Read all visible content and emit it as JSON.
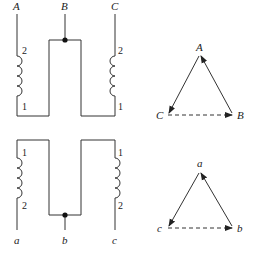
{
  "diagram": {
    "primary": {
      "terminals": [
        "A",
        "B",
        "C"
      ],
      "coil_left_labels": {
        "top": "2",
        "bottom": "1"
      },
      "coil_right_labels": {
        "top": "2",
        "bottom": "1"
      }
    },
    "secondary": {
      "terminals": [
        "a",
        "b",
        "c"
      ],
      "coil_left_labels": {
        "top": "1",
        "bottom": "2"
      },
      "coil_right_labels": {
        "top": "1",
        "bottom": "2"
      }
    },
    "phasor_upper": {
      "vertices": {
        "top": "A",
        "left": "C",
        "right": "B"
      },
      "solid_edges": [
        "C->A",
        "A->B"
      ],
      "dashed_edges": [
        "C->B"
      ]
    },
    "phasor_lower": {
      "vertices": {
        "top": "a",
        "left": "c",
        "right": "b"
      },
      "solid_edges": [
        "c->a",
        "a->b"
      ],
      "dashed_edges": [
        "c->b"
      ]
    },
    "colors": {
      "line": "#333333",
      "background": "#ffffff"
    }
  }
}
